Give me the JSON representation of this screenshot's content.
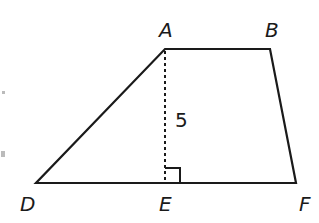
{
  "diagram": {
    "type": "trapezoid",
    "vertices": {
      "A": {
        "label": "A",
        "x": 165,
        "y": 49
      },
      "B": {
        "label": "B",
        "x": 270,
        "y": 49
      },
      "D": {
        "label": "D",
        "x": 36,
        "y": 183
      },
      "E": {
        "label": "E",
        "x": 165,
        "y": 183
      },
      "F": {
        "label": "F",
        "x": 296,
        "y": 183
      }
    },
    "height_segment": {
      "from": "A",
      "to": "E",
      "style": "dotted",
      "length_label": "5"
    },
    "right_angle_marker": "E",
    "colors": {
      "stroke": "#1a1a1a",
      "background": "#ffffff"
    }
  }
}
